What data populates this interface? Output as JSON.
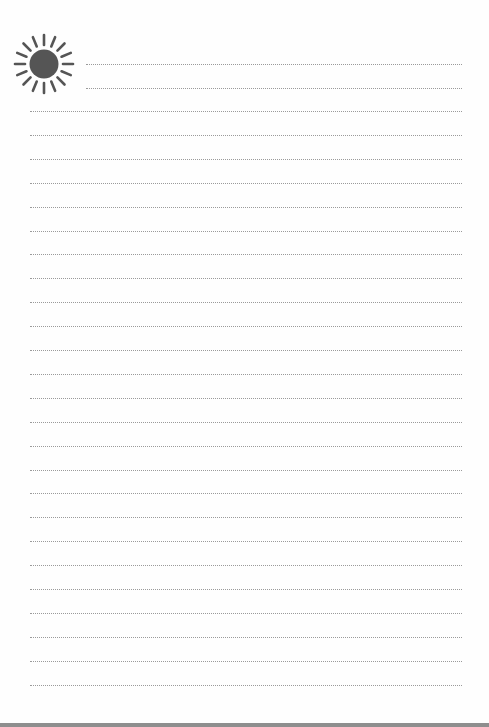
{
  "document": {
    "type": "lined-notepaper",
    "header_icon": "sun-icon",
    "colors": {
      "paper": "#fefefe",
      "rule": "#9a9a9a",
      "sun": "#555555",
      "bottom_edge": "#8e8e8e"
    },
    "short_rules": {
      "count": 2,
      "start_y": 64,
      "spacing": 23.8
    },
    "full_rules": {
      "count": 25,
      "start_y": 111,
      "spacing": 23.9
    }
  }
}
